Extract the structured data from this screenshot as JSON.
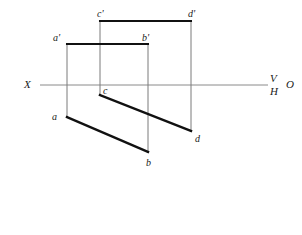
{
  "drawing": {
    "title": "Orthographic projection of plane ABCD",
    "canvas": {
      "width": 302,
      "height": 235
    },
    "colors": {
      "object_line": "#111111",
      "projector_line": "#7a7a7a",
      "ground_line": "#8a8a8a",
      "text": "#1a1a1a",
      "background": "#ffffff"
    },
    "ground_line": {
      "name": "XO-axis",
      "y": 85,
      "x_start": 40,
      "x_end": 268,
      "left_label": "X",
      "right_label_top": "V",
      "right_label_bottom": "H",
      "origin_label": "O"
    },
    "points": [
      {
        "id": "a_front",
        "label": "a'",
        "x": 67,
        "y": 44,
        "label_x": 53,
        "label_y": 33,
        "view": "front"
      },
      {
        "id": "b_front",
        "label": "b'",
        "x": 148,
        "y": 44,
        "label_x": 142,
        "label_y": 33,
        "view": "front"
      },
      {
        "id": "c_front",
        "label": "c'",
        "x": 100,
        "y": 21,
        "label_x": 97,
        "label_y": 9,
        "view": "front"
      },
      {
        "id": "d_front",
        "label": "d'",
        "x": 191,
        "y": 21,
        "label_x": 188,
        "label_y": 9,
        "view": "front"
      },
      {
        "id": "a_top",
        "label": "a",
        "x": 67,
        "y": 117,
        "label_x": 52,
        "label_y": 112,
        "view": "top"
      },
      {
        "id": "b_top",
        "label": "b",
        "x": 148,
        "y": 152,
        "label_x": 146,
        "label_y": 158,
        "view": "top"
      },
      {
        "id": "c_top",
        "label": "c",
        "x": 100,
        "y": 95,
        "label_x": 103,
        "label_y": 86,
        "view": "top"
      },
      {
        "id": "d_top",
        "label": "d",
        "x": 191,
        "y": 131,
        "label_x": 195,
        "label_y": 134,
        "view": "top"
      }
    ],
    "object_lines": [
      {
        "name": "front-line-a-b",
        "x1": 67,
        "y1": 44,
        "x2": 148,
        "y2": 44
      },
      {
        "name": "front-line-c-d",
        "x1": 100,
        "y1": 21,
        "x2": 191,
        "y2": 21
      },
      {
        "name": "top-line-a-b",
        "x1": 67,
        "y1": 117,
        "x2": 148,
        "y2": 152
      },
      {
        "name": "top-line-c-d",
        "x1": 100,
        "y1": 95,
        "x2": 191,
        "y2": 131
      }
    ],
    "projector_lines": [
      {
        "name": "projector-a",
        "x": 67,
        "y1": 44,
        "y2": 117
      },
      {
        "name": "projector-c",
        "x": 100,
        "y1": 21,
        "y2": 95
      },
      {
        "name": "projector-b",
        "x": 148,
        "y1": 44,
        "y2": 152
      },
      {
        "name": "projector-d",
        "x": 191,
        "y1": 21,
        "y2": 131
      }
    ]
  }
}
